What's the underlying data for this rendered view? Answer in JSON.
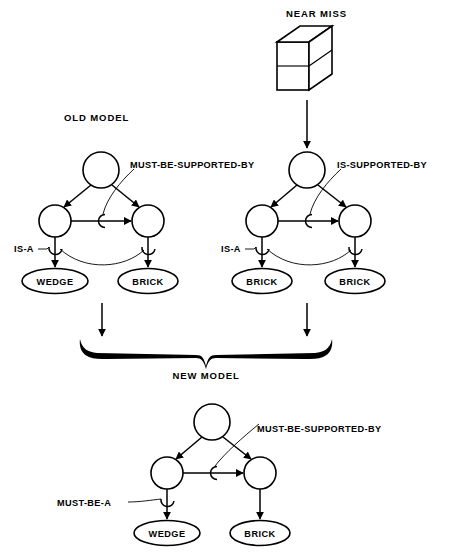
{
  "figure": {
    "title_near_miss": "NEAR MISS",
    "title_old_model": "OLD MODEL",
    "title_new_model": "NEW MODEL"
  },
  "colors": {
    "ink": "#000000",
    "paper": "#ffffff"
  },
  "near_miss": {
    "label": "NEAR MISS",
    "icon": "3d-block-two-slabs"
  },
  "old_model": {
    "title": "OLD MODEL",
    "link_label_top": "MUST-BE-SUPPORTED-BY",
    "link_label_left": "IS-A",
    "node_left": "WEDGE",
    "node_right": "BRICK"
  },
  "near_miss_model": {
    "link_label_top": "IS-SUPPORTED-BY",
    "link_label_left": "IS-A",
    "node_left": "BRICK",
    "node_right": "BRICK"
  },
  "new_model": {
    "title": "NEW MODEL",
    "link_label_top": "MUST-BE-SUPPORTED-BY",
    "link_label_left": "MUST-BE-A",
    "node_left": "WEDGE",
    "node_right": "BRICK"
  }
}
